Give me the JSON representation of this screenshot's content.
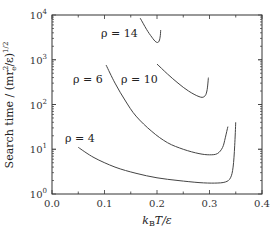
{
  "chart_data": {
    "type": "line",
    "title": "",
    "xlabel": "k_B T / ε",
    "ylabel": "Search time / (m r_e^2 / ε)^{1/2}",
    "xlim": [
      0.0,
      0.4
    ],
    "ylim": [
      1,
      10000
    ],
    "yscale": "log",
    "grid": false,
    "legend": "none (inline curve labels)",
    "x_ticks": [
      "0.0",
      "0.1",
      "0.2",
      "0.3",
      "0.4"
    ],
    "y_ticks": [
      "10^0",
      "10^1",
      "10^2",
      "10^3",
      "10^4"
    ],
    "series": [
      {
        "name": "ρ = 4",
        "label_text": "ρ = 4",
        "x": [
          0.05,
          0.08,
          0.12,
          0.16,
          0.2,
          0.24,
          0.28,
          0.31,
          0.33,
          0.34,
          0.345,
          0.348,
          0.35
        ],
        "y": [
          11,
          6.5,
          4.0,
          2.9,
          2.3,
          2.0,
          1.8,
          1.75,
          1.85,
          2.3,
          4.0,
          12,
          40
        ]
      },
      {
        "name": "ρ = 6",
        "label_text": "ρ = 6",
        "x": [
          0.103,
          0.12,
          0.14,
          0.16,
          0.19,
          0.22,
          0.25,
          0.28,
          0.3,
          0.315,
          0.325,
          0.33,
          0.335
        ],
        "y": [
          760,
          300,
          120,
          55,
          25,
          14,
          10,
          8,
          7.5,
          8,
          11,
          18,
          32
        ]
      },
      {
        "name": "ρ = 10",
        "label_text": "ρ = 10",
        "x": [
          0.2,
          0.22,
          0.24,
          0.26,
          0.28,
          0.29,
          0.295,
          0.298
        ],
        "y": [
          800,
          480,
          300,
          200,
          150,
          150,
          200,
          400
        ]
      },
      {
        "name": "ρ = 14",
        "label_text": "ρ = 14",
        "x": [
          0.168,
          0.18,
          0.19,
          0.198,
          0.203,
          0.206,
          0.207
        ],
        "y": [
          8500,
          4800,
          3200,
          2500,
          2500,
          3200,
          4600
        ]
      }
    ],
    "annotations": [
      "ρ = 14",
      "ρ = 10",
      "ρ = 6",
      "ρ = 4"
    ]
  },
  "axes": {
    "x_title_main": "k",
    "x_title_sub": "B",
    "x_title_rest": "T/ε",
    "y_title": "Search time / (mr",
    "y_title_sub": "e",
    "y_title_sup": "2",
    "y_title_rest": "/ε)",
    "y_title_exp": "1/2",
    "x_tick_labels": [
      "0.0",
      "0.1",
      "0.2",
      "0.3",
      "0.4"
    ],
    "y_tick_base": "10",
    "y_tick_exps": [
      "0",
      "1",
      "2",
      "3",
      "4"
    ]
  },
  "labels": {
    "rho14": "ρ = 14",
    "rho10": "ρ = 10",
    "rho6": "ρ = 6",
    "rho4": "ρ = 4"
  },
  "colors": {
    "curve": "#444444",
    "axis": "#333333",
    "background": "#ffffff"
  }
}
